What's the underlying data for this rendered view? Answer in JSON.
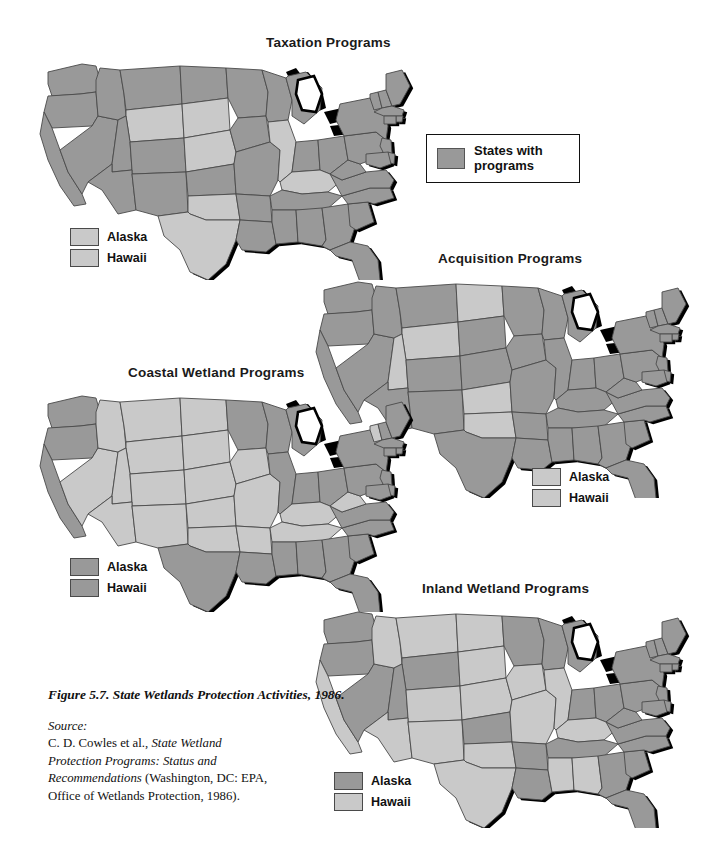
{
  "figure": {
    "caption_title": "Figure 5.7.  State Wetlands Protection Activities, 1986.",
    "source_label": "Source:",
    "source_line1": "C. D. Cowles et al., ",
    "source_italic1": "State Wetland",
    "source_line2": "Protection Programs: Status and",
    "source_line3": "Recommendations",
    "source_line3_rest": " (Washington, DC: EPA,",
    "source_line4": "Office of Wetlands Protection, 1986)."
  },
  "legend": {
    "swatch_name": "program-swatch",
    "label_line1": "States with",
    "label_line2": "programs"
  },
  "colors": {
    "with_program": "#999999",
    "without_program": "#c9c9c9",
    "border": "#4a4a4a",
    "shadow": "#000000",
    "background": "#ffffff"
  },
  "ak_hi_labels": {
    "alaska": "Alaska",
    "hawaii": "Hawaii"
  },
  "chart_data": {
    "type": "map",
    "title": "State Wetlands Protection Activities, 1986",
    "map_projection": "usa-albers-like",
    "categories": [
      "with programs",
      "without programs"
    ],
    "legend": "States with programs",
    "panels": [
      {
        "id": "taxation",
        "title": "Taxation Programs",
        "alaska": "without",
        "hawaii": "without",
        "with_programs": [
          "WA",
          "OR",
          "ID",
          "MT",
          "CA",
          "NV",
          "UT",
          "AZ",
          "NM",
          "ND",
          "MN",
          "IA",
          "MO",
          "KS",
          "WI",
          "MI",
          "IN",
          "OH",
          "PA",
          "NY",
          "VT",
          "NH",
          "ME",
          "MA",
          "CT",
          "RI",
          "NJ",
          "DE",
          "MD",
          "WV",
          "VA",
          "NC",
          "SC",
          "GA",
          "FL",
          "AL",
          "MS",
          "LA",
          "TN",
          "AR",
          "CO"
        ],
        "without_programs": [
          "WY",
          "SD",
          "NE",
          "OK",
          "TX",
          "IL",
          "KY",
          "HI",
          "AK"
        ]
      },
      {
        "id": "acquisition",
        "title": "Acquisition Programs",
        "alaska": "without",
        "hawaii": "without",
        "with_programs": [
          "WA",
          "OR",
          "ID",
          "CA",
          "NV",
          "MT",
          "SD",
          "NE",
          "MN",
          "IA",
          "MO",
          "WI",
          "MI",
          "IL",
          "IN",
          "OH",
          "KY",
          "TN",
          "PA",
          "NY",
          "VT",
          "NH",
          "ME",
          "MA",
          "CT",
          "RI",
          "NJ",
          "DE",
          "MD",
          "WV",
          "VA",
          "NC",
          "SC",
          "GA",
          "FL",
          "AL",
          "MS",
          "LA",
          "AR",
          "TX",
          "NM",
          "CO",
          "AZ"
        ],
        "without_programs": [
          "ND",
          "WY",
          "UT",
          "KS",
          "OK",
          "HI",
          "AK"
        ]
      },
      {
        "id": "coastal",
        "title": "Coastal Wetland Programs",
        "alaska": "with",
        "hawaii": "with",
        "with_programs": [
          "WA",
          "OR",
          "CA",
          "ME",
          "NH",
          "MA",
          "RI",
          "CT",
          "NY",
          "NJ",
          "DE",
          "MD",
          "VA",
          "NC",
          "SC",
          "GA",
          "FL",
          "AL",
          "MS",
          "LA",
          "TX",
          "MI",
          "WI",
          "MN",
          "OH",
          "PA",
          "IN",
          "IL"
        ],
        "without_programs": [
          "ID",
          "NV",
          "MT",
          "WY",
          "UT",
          "AZ",
          "NM",
          "CO",
          "ND",
          "SD",
          "NE",
          "KS",
          "OK",
          "MO",
          "IA",
          "AR",
          "TN",
          "KY",
          "WV"
        ]
      },
      {
        "id": "inland",
        "title": "Inland Wetland Programs",
        "alaska": "with",
        "hawaii": "without",
        "with_programs": [
          "WA",
          "OR",
          "NV",
          "WY",
          "UT",
          "KS",
          "MN",
          "WI",
          "MI",
          "IN",
          "OH",
          "PA",
          "NY",
          "VT",
          "NH",
          "ME",
          "MA",
          "CT",
          "RI",
          "NJ",
          "DE",
          "MD",
          "WV",
          "VA",
          "NC",
          "SC",
          "GA",
          "FL",
          "TN",
          "AR",
          "LA"
        ],
        "without_programs": [
          "CA",
          "ID",
          "MT",
          "ND",
          "SD",
          "NE",
          "CO",
          "AZ",
          "NM",
          "OK",
          "TX",
          "IA",
          "MO",
          "IL",
          "KY",
          "AL",
          "MS",
          "HI"
        ]
      }
    ]
  },
  "panel_titles": {
    "taxation": "Taxation Programs",
    "acquisition": "Acquisition Programs",
    "coastal": "Coastal Wetland Programs",
    "inland": "Inland Wetland Programs"
  }
}
